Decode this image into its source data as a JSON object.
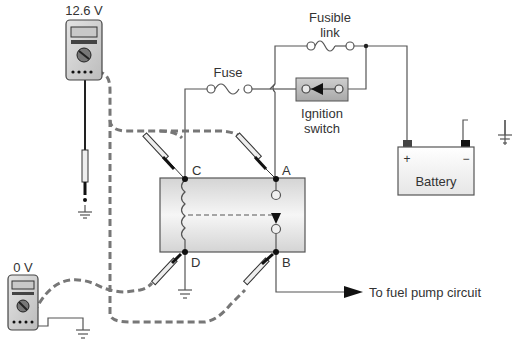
{
  "diagram": {
    "meters": [
      {
        "id": "meter-top",
        "reading": "12.6 V"
      },
      {
        "id": "meter-bottom",
        "reading": "0 V"
      }
    ],
    "components": {
      "fusible_link": {
        "label_line1": "Fusible",
        "label_line2": "link"
      },
      "fuse": {
        "label": "Fuse"
      },
      "ignition_switch": {
        "label_line1": "Ignition",
        "label_line2": "switch"
      },
      "battery": {
        "label": "Battery",
        "positive": "+",
        "negative": "−"
      },
      "relay": {
        "terminals": {
          "A": "A",
          "B": "B",
          "C": "C",
          "D": "D"
        }
      }
    },
    "output": {
      "label": "To fuel pump circuit"
    },
    "colors": {
      "wire": "#555555",
      "probe_lead": "#777777",
      "relay_fill_top": "#d8d8d8",
      "relay_fill_mid": "#f4f4f4",
      "text": "#333333"
    }
  }
}
